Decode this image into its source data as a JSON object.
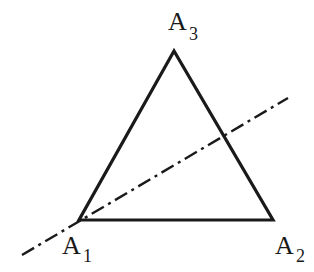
{
  "diagram": {
    "type": "triangle-with-axis",
    "stroke_color": "#1a1a1a",
    "background": "#ffffff",
    "vertices": [
      {
        "id": "A1",
        "letter": "A",
        "subscript": "1",
        "x": 79,
        "y": 220
      },
      {
        "id": "A2",
        "letter": "A",
        "subscript": "2",
        "x": 273,
        "y": 220
      },
      {
        "id": "A3",
        "letter": "A",
        "subscript": "3",
        "x": 174,
        "y": 51
      }
    ],
    "axis_line": {
      "style": "dash-dot",
      "x1": 22,
      "y1": 255,
      "x2": 288,
      "y2": 98
    }
  }
}
